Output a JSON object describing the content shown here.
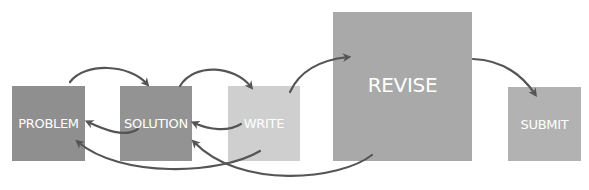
{
  "diagram": {
    "type": "process-flow",
    "nodes": [
      {
        "id": "problem",
        "label": "PROBLEM",
        "color": "#8f8f8f"
      },
      {
        "id": "solution",
        "label": "SOLUTION",
        "color": "#939393"
      },
      {
        "id": "write",
        "label": "WRITE",
        "color": "#cfcfcf"
      },
      {
        "id": "revise",
        "label": "REVISE",
        "color": "#a9a9a9"
      },
      {
        "id": "submit",
        "label": "SUBMIT",
        "color": "#b2b2b2"
      }
    ],
    "edges": [
      {
        "from": "problem",
        "to": "solution",
        "direction": "forward"
      },
      {
        "from": "solution",
        "to": "write",
        "direction": "forward"
      },
      {
        "from": "write",
        "to": "revise",
        "direction": "forward"
      },
      {
        "from": "revise",
        "to": "submit",
        "direction": "forward"
      },
      {
        "from": "solution",
        "to": "problem",
        "direction": "back"
      },
      {
        "from": "write",
        "to": "solution",
        "direction": "back"
      },
      {
        "from": "write",
        "to": "problem",
        "direction": "back"
      },
      {
        "from": "revise",
        "to": "solution",
        "direction": "back"
      }
    ],
    "arrow_color": "#555555"
  }
}
